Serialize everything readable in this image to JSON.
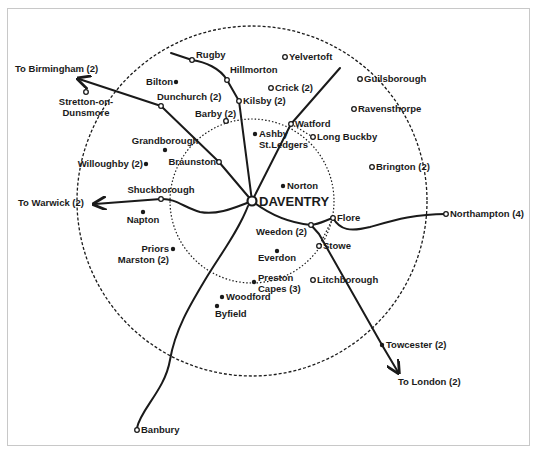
{
  "map": {
    "title": "",
    "center": {
      "name": "DAVENTRY",
      "x": 252,
      "y": 201
    },
    "colors": {
      "ink": "#1a1a1a",
      "frame": "#c8c8c8",
      "background": "#ffffff"
    },
    "circles": [
      {
        "name": "outer-radius-circle",
        "cx": 252,
        "cy": 201,
        "r": 175,
        "style": "dashed"
      },
      {
        "name": "inner-radius-circle",
        "cx": 252,
        "cy": 201,
        "r": 82,
        "style": "dotted"
      }
    ],
    "places": [
      {
        "name": "Rugby",
        "x": 192,
        "y": 60,
        "marker": "open",
        "label_dx": 4,
        "label_dy": -2,
        "anchor": "start"
      },
      {
        "name": "Hillmorton",
        "x": 227,
        "y": 80,
        "marker": "open",
        "label_dx": 3,
        "label_dy": -7,
        "anchor": "start"
      },
      {
        "name": "Yelvertoft",
        "x": 285,
        "y": 57,
        "marker": "open",
        "label_dx": 4,
        "label_dy": 3,
        "anchor": "start"
      },
      {
        "name": "Crick (2)",
        "x": 271,
        "y": 88,
        "marker": "open",
        "label_dx": 4,
        "label_dy": 3,
        "anchor": "start"
      },
      {
        "name": "Kilsby (2)",
        "x": 239,
        "y": 101,
        "marker": "open",
        "label_dx": 4,
        "label_dy": 3,
        "anchor": "start"
      },
      {
        "name": "Bilton",
        "x": 176,
        "y": 82,
        "marker": "filled",
        "label_dx": -3,
        "label_dy": 3,
        "anchor": "end"
      },
      {
        "name": "Stretton-on-\nDunsmore",
        "x": 86,
        "y": 92,
        "marker": "open",
        "label_dx": 0,
        "label_dy": 13,
        "anchor": "middle"
      },
      {
        "name": "Dunchurch (2)",
        "x": 161,
        "y": 106,
        "marker": "open",
        "label_dx": -4,
        "label_dy": -6,
        "anchor": "start"
      },
      {
        "name": "Barby (2)",
        "x": 226,
        "y": 121,
        "marker": "open",
        "label_dx": -31,
        "label_dy": -4,
        "anchor": "start"
      },
      {
        "name": "Watford",
        "x": 291,
        "y": 124,
        "marker": "open",
        "label_dx": 4,
        "label_dy": 3,
        "anchor": "start"
      },
      {
        "name": "Long Buckby",
        "x": 313,
        "y": 137,
        "marker": "open",
        "label_dx": 4,
        "label_dy": 3,
        "anchor": "start"
      },
      {
        "name": "Guilsborough",
        "x": 360,
        "y": 79,
        "marker": "open",
        "label_dx": 4,
        "label_dy": 3,
        "anchor": "start"
      },
      {
        "name": "Ravensthorpe",
        "x": 354,
        "y": 109,
        "marker": "open",
        "label_dx": 4,
        "label_dy": 3,
        "anchor": "start"
      },
      {
        "name": "Ashby\nSt.Ledgers",
        "x": 255,
        "y": 134,
        "marker": "filled",
        "label_dx": 4,
        "label_dy": 3,
        "anchor": "start"
      },
      {
        "name": "Grandborough",
        "x": 165,
        "y": 150,
        "marker": "filled",
        "label_dx": 0,
        "label_dy": -6,
        "anchor": "middle"
      },
      {
        "name": "Willoughby (2)",
        "x": 146,
        "y": 164,
        "marker": "filled",
        "label_dx": -3,
        "label_dy": 3,
        "anchor": "end"
      },
      {
        "name": "Braunston",
        "x": 219,
        "y": 162,
        "marker": "open",
        "label_dx": -3,
        "label_dy": 3,
        "anchor": "end"
      },
      {
        "name": "Brington (2)",
        "x": 372,
        "y": 167,
        "marker": "open",
        "label_dx": 4,
        "label_dy": 3,
        "anchor": "start"
      },
      {
        "name": "Norton",
        "x": 283,
        "y": 186,
        "marker": "filled",
        "label_dx": 4,
        "label_dy": 3,
        "anchor": "start"
      },
      {
        "name": "Shuckborough",
        "x": 161,
        "y": 199,
        "marker": "open",
        "label_dx": 0,
        "label_dy": -6,
        "anchor": "middle"
      },
      {
        "name": "Napton",
        "x": 143,
        "y": 212,
        "marker": "filled",
        "label_dx": 0,
        "label_dy": 11,
        "anchor": "middle"
      },
      {
        "name": "Flore",
        "x": 333,
        "y": 218,
        "marker": "open",
        "label_dx": 4,
        "label_dy": 3,
        "anchor": "start"
      },
      {
        "name": "Northampton (4)",
        "x": 446,
        "y": 214,
        "marker": "open",
        "label_dx": 4,
        "label_dy": 3,
        "anchor": "start"
      },
      {
        "name": "Weedon (2)",
        "x": 311,
        "y": 225,
        "marker": "open",
        "label_dx": -4,
        "label_dy": 10,
        "anchor": "end"
      },
      {
        "name": "Stowe",
        "x": 319,
        "y": 246,
        "marker": "open",
        "label_dx": 4,
        "label_dy": 3,
        "anchor": "start"
      },
      {
        "name": "Everdon",
        "x": 277,
        "y": 251,
        "marker": "filled",
        "label_dx": 0,
        "label_dy": 10,
        "anchor": "middle"
      },
      {
        "name": "Priors\nMarston (2)",
        "x": 173,
        "y": 249,
        "marker": "filled",
        "label_dx": -4,
        "label_dy": 3,
        "anchor": "end"
      },
      {
        "name": "Preston\nCapes (3)",
        "x": 254,
        "y": 282,
        "marker": "filled",
        "label_dx": 4,
        "label_dy": -1,
        "anchor": "start"
      },
      {
        "name": "Litchborough",
        "x": 313,
        "y": 280,
        "marker": "open",
        "label_dx": 4,
        "label_dy": 3,
        "anchor": "start"
      },
      {
        "name": "Woodford",
        "x": 222,
        "y": 297,
        "marker": "filled",
        "label_dx": 4,
        "label_dy": 3,
        "anchor": "start"
      },
      {
        "name": "Byfield",
        "x": 217,
        "y": 306,
        "marker": "filled",
        "label_dx": -2,
        "label_dy": 11,
        "anchor": "start"
      },
      {
        "name": "Towcester (2)",
        "x": 382,
        "y": 345,
        "marker": "filled",
        "label_dx": 4,
        "label_dy": 3,
        "anchor": "start"
      },
      {
        "name": "Banbury",
        "x": 137,
        "y": 430,
        "marker": "open",
        "label_dx": 4,
        "label_dy": 3,
        "anchor": "start"
      }
    ],
    "destinations": [
      {
        "name": "To Birmingham (2)",
        "x": 15,
        "y": 72,
        "anchor": "start"
      },
      {
        "name": "To Warwick (2)",
        "x": 18,
        "y": 206,
        "anchor": "start"
      },
      {
        "name": "To London (2)",
        "x": 398,
        "y": 385,
        "anchor": "start"
      }
    ],
    "routes": [
      {
        "name": "route-birmingham",
        "d": "M252,201 L219,162 L161,106 L79,79",
        "arrow": true
      },
      {
        "name": "route-rugby",
        "d": "M252,201 L239,101 L227,80 C220,68 205,62 192,60 L171,53",
        "arrow": false
      },
      {
        "name": "route-watford",
        "d": "M252,201 L291,124 L340,68",
        "arrow": false
      },
      {
        "name": "route-warwick",
        "d": "M252,201 C230,210 215,215 200,212 C185,208 175,198 161,199 L95,204",
        "arrow": true
      },
      {
        "name": "route-banbury",
        "d": "M248,206 C238,232 220,255 205,280 C190,305 175,330 170,360 C165,390 140,410 137,428",
        "arrow": false
      },
      {
        "name": "route-weedon",
        "d": "M252,201 C270,215 290,223 311,225 C320,224 326,220 333,218",
        "arrow": false
      },
      {
        "name": "route-northampton",
        "d": "M333,218 C340,230 350,232 370,227 C395,220 415,214 446,214",
        "arrow": false
      },
      {
        "name": "route-london",
        "d": "M311,225 L319,234 L382,345 L398,372",
        "arrow": true
      }
    ],
    "inner_links": [
      {
        "name": "link-watford-longbuckby",
        "d": "M291,124 L313,137"
      },
      {
        "name": "link-flore-stowe",
        "d": "M333,218 L319,246"
      }
    ]
  }
}
